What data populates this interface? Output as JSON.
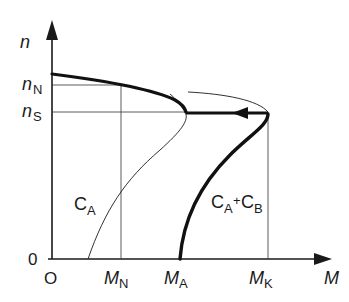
{
  "diagram": {
    "type": "torque-speed characteristic",
    "axes": {
      "y_label": "n",
      "x_label": "M",
      "origin_x": "O",
      "origin_y": "0"
    },
    "y_ticks": {
      "nN": {
        "main": "n",
        "sub": "N"
      },
      "nS": {
        "main": "n",
        "sub": "S"
      }
    },
    "x_ticks": {
      "MN": {
        "main": "M",
        "sub": "N"
      },
      "MA": {
        "main": "M",
        "sub": "A"
      },
      "MK": {
        "main": "M",
        "sub": "K"
      }
    },
    "curves": {
      "CA": {
        "main": "C",
        "sub": "A"
      },
      "CAB": {
        "main1": "C",
        "sub1": "A",
        "plus": "+",
        "main2": "C",
        "sub2": "B"
      }
    }
  }
}
